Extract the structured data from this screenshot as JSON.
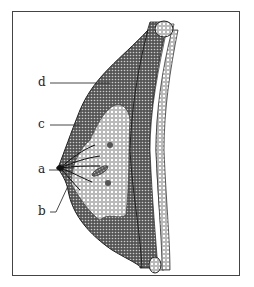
{
  "figure": {
    "labels": [
      {
        "key": "d",
        "text": "d"
      },
      {
        "key": "c",
        "text": "c"
      },
      {
        "key": "a",
        "text": "a"
      },
      {
        "key": "b",
        "text": "b"
      }
    ]
  }
}
